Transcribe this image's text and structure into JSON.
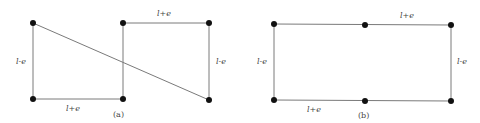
{
  "panels": [
    {
      "id": "a",
      "caption": "(a)",
      "labels": {
        "left": "l-e",
        "bottom": "l+e",
        "top": "l+e",
        "right": "l-e"
      }
    },
    {
      "id": "b",
      "caption": "(b)",
      "labels": {
        "left": "l-e",
        "top": "l+e",
        "bottom": "l+e",
        "right": "l-e"
      }
    }
  ],
  "colors": {
    "edge": "#7a7a7a",
    "node": "#111111",
    "text": "#444444"
  }
}
